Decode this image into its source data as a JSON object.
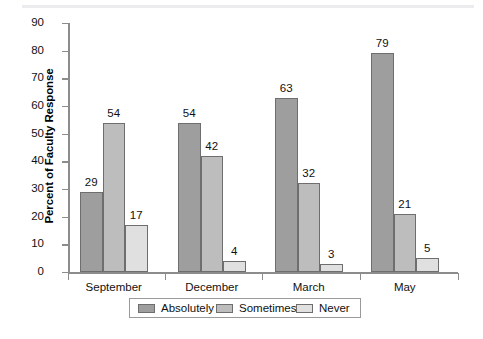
{
  "chart_data": {
    "type": "bar",
    "title": "",
    "xlabel": "",
    "ylabel": "Percent of Faculty Response",
    "ylim": [
      0,
      90
    ],
    "yticks": [
      0,
      10,
      20,
      30,
      40,
      50,
      60,
      70,
      80,
      90
    ],
    "ytick_labels": [
      "0",
      "10",
      "20",
      "30",
      "40",
      "50",
      "60",
      "70",
      "80",
      "90"
    ],
    "grid": false,
    "legend_position": "bottom",
    "categories": [
      "September",
      "December",
      "March",
      "May"
    ],
    "series": [
      {
        "name": "Absolutely",
        "color": "#9e9e9e",
        "values": [
          29,
          54,
          63,
          79
        ],
        "labels": [
          "29",
          "54",
          "63",
          "79"
        ]
      },
      {
        "name": "Sometimes",
        "color": "#bdbdbd",
        "values": [
          54,
          42,
          32,
          21
        ],
        "labels": [
          "54",
          "42",
          "32",
          "21"
        ]
      },
      {
        "name": "Never",
        "color": "#e0e0e0",
        "values": [
          17,
          4,
          3,
          5
        ],
        "labels": [
          "17",
          "4",
          "3",
          "5"
        ]
      }
    ]
  },
  "colors": {
    "absolutely": "#9e9e9e",
    "sometimes": "#bdbdbd",
    "never": "#e0e0e0",
    "bar_border": "#6e6e6e",
    "axis": "#8c8c8c",
    "text": "#111111",
    "background": "#ffffff"
  }
}
